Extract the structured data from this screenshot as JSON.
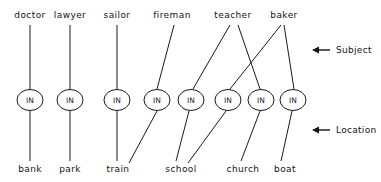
{
  "diagram": {
    "width": 381,
    "height": 182,
    "colors": {
      "background": "#ffffff",
      "stroke": "#1a1a1a",
      "text": "#141414"
    },
    "node_label": "IN",
    "subject_row_y": 18,
    "node_row_y": 100,
    "location_row_y": 172,
    "subjects": [
      {
        "id": "doctor",
        "label": "doctor",
        "x": 30
      },
      {
        "id": "lawyer",
        "label": "lawyer",
        "x": 70
      },
      {
        "id": "sailor",
        "label": "sailor",
        "x": 117
      },
      {
        "id": "fireman",
        "label": "fireman",
        "x": 172
      },
      {
        "id": "teacher",
        "label": "teacher",
        "x": 233
      },
      {
        "id": "baker",
        "label": "baker",
        "x": 284
      }
    ],
    "nodes": [
      {
        "id": "n1",
        "label": "IN",
        "x": 30,
        "y": 100
      },
      {
        "id": "n2",
        "label": "IN",
        "x": 70,
        "y": 100
      },
      {
        "id": "n3",
        "label": "IN",
        "x": 117,
        "y": 100
      },
      {
        "id": "n4",
        "label": "IN",
        "x": 157,
        "y": 100
      },
      {
        "id": "n5",
        "label": "IN",
        "x": 191,
        "y": 100
      },
      {
        "id": "n6",
        "label": "IN",
        "x": 228,
        "y": 100
      },
      {
        "id": "n7",
        "label": "IN",
        "x": 261,
        "y": 100
      },
      {
        "id": "n8",
        "label": "IN",
        "x": 293,
        "y": 100
      }
    ],
    "locations": [
      {
        "id": "bank",
        "label": "bank",
        "x": 30
      },
      {
        "id": "park",
        "label": "park",
        "x": 70
      },
      {
        "id": "train",
        "label": "train",
        "x": 118
      },
      {
        "id": "school",
        "label": "school",
        "x": 181
      },
      {
        "id": "church",
        "label": "church",
        "x": 243
      },
      {
        "id": "boat",
        "label": "boat",
        "x": 285
      }
    ],
    "subject_edges": [
      {
        "from": "doctor",
        "to": "n1",
        "x1": 30,
        "y1": 25,
        "x2": 30,
        "y2": 89
      },
      {
        "from": "lawyer",
        "to": "n2",
        "x1": 70,
        "y1": 25,
        "x2": 70,
        "y2": 89
      },
      {
        "from": "sailor",
        "to": "n3",
        "x1": 117,
        "y1": 25,
        "x2": 117,
        "y2": 89
      },
      {
        "from": "fireman",
        "to": "n4",
        "x1": 174,
        "y1": 25,
        "x2": 157,
        "y2": 89
      },
      {
        "from": "teacher",
        "to": "n5",
        "x1": 230,
        "y1": 25,
        "x2": 193,
        "y2": 89
      },
      {
        "from": "teacher",
        "to": "n7",
        "x1": 238,
        "y1": 25,
        "x2": 260,
        "y2": 89
      },
      {
        "from": "baker",
        "to": "n6",
        "x1": 281,
        "y1": 25,
        "x2": 230,
        "y2": 89
      },
      {
        "from": "baker",
        "to": "n8",
        "x1": 284,
        "y1": 25,
        "x2": 294,
        "y2": 89
      }
    ],
    "location_edges": [
      {
        "from": "n1",
        "to": "bank",
        "x1": 30,
        "y1": 111,
        "x2": 30,
        "y2": 161
      },
      {
        "from": "n2",
        "to": "park",
        "x1": 70,
        "y1": 111,
        "x2": 70,
        "y2": 161
      },
      {
        "from": "n3",
        "to": "train",
        "x1": 117,
        "y1": 111,
        "x2": 117,
        "y2": 161
      },
      {
        "from": "n4",
        "to": "train",
        "x1": 157,
        "y1": 111,
        "x2": 129,
        "y2": 163
      },
      {
        "from": "n5",
        "to": "school",
        "x1": 189,
        "y1": 111,
        "x2": 176,
        "y2": 161
      },
      {
        "from": "n6",
        "to": "school",
        "x1": 226,
        "y1": 111,
        "x2": 188,
        "y2": 163
      },
      {
        "from": "n7",
        "to": "church",
        "x1": 260,
        "y1": 111,
        "x2": 241,
        "y2": 161
      },
      {
        "from": "n8",
        "to": "boat",
        "x1": 292,
        "y1": 111,
        "x2": 281,
        "y2": 161
      }
    ],
    "annotations": [
      {
        "id": "subject",
        "label": "Subject",
        "arrow_y": 50,
        "arrow_x_tip": 312,
        "arrow_x_tail": 330,
        "text_x": 336
      },
      {
        "id": "location",
        "label": "Location",
        "arrow_y": 130,
        "arrow_x_tip": 312,
        "arrow_x_tail": 330,
        "text_x": 336
      }
    ]
  }
}
